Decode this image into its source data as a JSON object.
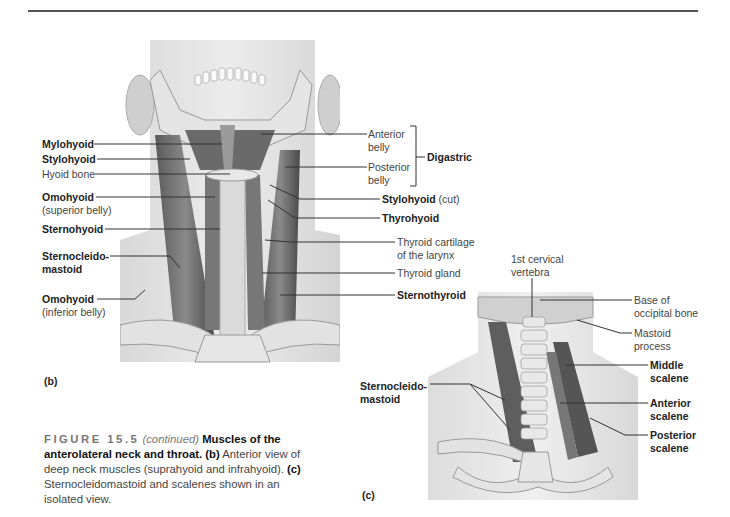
{
  "page": {
    "top_rule": true
  },
  "panel_b": {
    "letter": "(b)",
    "left_labels": [
      {
        "text": "Mylohyoid",
        "bold": true
      },
      {
        "text": "Stylohyoid",
        "bold": true
      },
      {
        "text": "Hyoid bone",
        "bold": false
      },
      {
        "text": "Omohyoid",
        "bold": true,
        "sub": "(superior belly)"
      },
      {
        "text": "Sternohyoid",
        "bold": true
      },
      {
        "text": "Sternocleido-",
        "bold": true,
        "line2": "mastoid"
      },
      {
        "text": "Omohyoid",
        "bold": true,
        "sub": "(inferior belly)"
      }
    ],
    "right_labels": [
      {
        "text": "Anterior",
        "line2": "belly",
        "bold": false
      },
      {
        "text": "Posterior",
        "line2": "belly",
        "bold": false
      },
      {
        "group": "Digastric"
      },
      {
        "text": "Stylohyoid",
        "suffix": "(cut)",
        "bold": true
      },
      {
        "text": "Thyrohyoid",
        "bold": true
      },
      {
        "text": "Thyroid cartilage",
        "line2": "of the larynx",
        "bold": false
      },
      {
        "text": "Thyroid gland",
        "bold": false
      },
      {
        "text": "Sternothyroid",
        "bold": true
      }
    ]
  },
  "panel_c": {
    "letter": "(c)",
    "top_label": {
      "text": "1st cervical",
      "line2": "vertebra"
    },
    "left_label": {
      "text": "Sternocleido-",
      "line2": "mastoid"
    },
    "right_labels": [
      {
        "text": "Base of",
        "line2": "occipital bone",
        "bold": false
      },
      {
        "text": "Mastoid",
        "line2": "process",
        "bold": false
      },
      {
        "text": "Middle",
        "line2": "scalene",
        "bold": true
      },
      {
        "text": "Anterior",
        "line2": "scalene",
        "bold": true
      },
      {
        "text": "Posterior",
        "line2": "scalene",
        "bold": true
      }
    ]
  },
  "caption": {
    "figure_number": "FIGURE 15.5",
    "continued": "(continued)",
    "title": "Muscles of the anterolateral neck and throat.",
    "b_label": "(b)",
    "b_text": "Anterior view of deep neck muscles (suprahyoid and infrahyoid).",
    "c_label": "(c)",
    "c_text": "Sternocleidomastoid and scalenes shown in an isolated view."
  }
}
